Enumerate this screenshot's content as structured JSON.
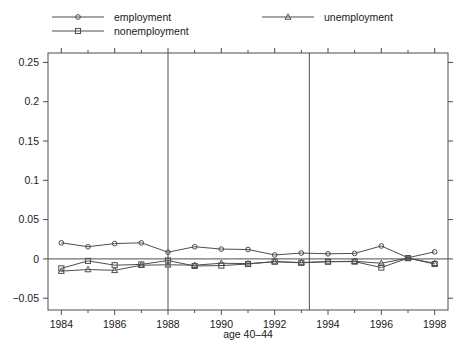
{
  "chart_data": {
    "type": "line",
    "title": "",
    "xlabel": "age 40–44",
    "ylabel": "",
    "xlim": [
      1983.5,
      1998.5
    ],
    "ylim": [
      -0.065,
      0.262
    ],
    "grid": false,
    "legend_position": "top",
    "x": [
      1984,
      1985,
      1986,
      1987,
      1988,
      1989,
      1990,
      1991,
      1992,
      1993,
      1994,
      1995,
      1996,
      1997,
      1998
    ],
    "xticks": [
      1984,
      1986,
      1988,
      1990,
      1992,
      1994,
      1996,
      1998
    ],
    "xticklabels": [
      "1984",
      "1986",
      "1988",
      "1990",
      "1992",
      "1994",
      "1996",
      "1998"
    ],
    "xminorticks": [
      1985,
      1987,
      1989,
      1991,
      1993,
      1995,
      1997
    ],
    "yticks": [
      -0.05,
      0,
      0.05,
      0.1,
      0.15,
      0.2,
      0.25
    ],
    "yticklabels": [
      "−0.05",
      "0",
      "0.05",
      "0.1",
      "0.15",
      "0.2",
      "0.25"
    ],
    "reference_lines": {
      "vertical": [
        1988.0,
        1993.3
      ],
      "horizontal": [
        0
      ]
    },
    "series": [
      {
        "name": "employment",
        "marker": "circle",
        "values": [
          0.0205,
          0.0155,
          0.0195,
          0.0205,
          0.0085,
          0.0155,
          0.0125,
          0.012,
          0.005,
          0.0075,
          0.0065,
          0.007,
          0.0165,
          0.0015,
          0.009
        ]
      },
      {
        "name": "nonemployment",
        "marker": "square",
        "values": [
          -0.012,
          -0.0025,
          -0.008,
          -0.007,
          -0.002,
          -0.009,
          -0.0085,
          -0.0065,
          -0.0035,
          -0.005,
          -0.0035,
          -0.0035,
          -0.011,
          0.001,
          -0.0065
        ]
      },
      {
        "name": "unemployment",
        "marker": "triangle",
        "values": [
          -0.0155,
          -0.0135,
          -0.0145,
          -0.008,
          -0.0075,
          -0.008,
          -0.0055,
          -0.006,
          -0.0035,
          -0.0045,
          -0.0035,
          -0.003,
          -0.0055,
          0.001,
          -0.0055
        ]
      }
    ]
  },
  "legend": {
    "items": [
      {
        "label": "employment",
        "marker": "circle"
      },
      {
        "label": "nonemployment",
        "marker": "square"
      },
      {
        "label": "unemployment",
        "marker": "triangle"
      }
    ]
  },
  "colors": {
    "line": "#4d4d4d",
    "text": "#1a1a1a",
    "background": "#ffffff"
  }
}
